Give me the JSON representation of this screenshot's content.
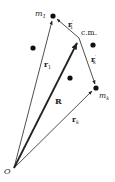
{
  "diagram": {
    "points": {
      "origin": {
        "label": "O",
        "x": 14,
        "y": 168
      },
      "m1": {
        "label": "m",
        "sub": "1",
        "x": 53,
        "y": 16
      },
      "cm": {
        "label": "c.m.",
        "x": 79,
        "y": 38
      },
      "mk": {
        "label": "m",
        "sub": "k",
        "x": 96,
        "y": 88
      }
    },
    "extra_masses": [
      {
        "x": 33,
        "y": 48
      },
      {
        "x": 93,
        "y": 45
      },
      {
        "x": 70,
        "y": 78
      }
    ],
    "vectors": [
      {
        "label": "r",
        "sub": "1",
        "from": "origin",
        "to": "m1",
        "weight": "thin"
      },
      {
        "label": "R",
        "sub": "",
        "from": "origin",
        "to": "cm",
        "weight": "bold"
      },
      {
        "label": "r",
        "sub": "k",
        "from": "origin",
        "to": "mk",
        "weight": "thin"
      },
      {
        "label": "r",
        "sub": "1",
        "prime": "′",
        "from": "cm",
        "to": "m1",
        "weight": "thin"
      },
      {
        "label": "r",
        "sub": "k",
        "prime": "′",
        "from": "cm",
        "to": "mk",
        "weight": "thin"
      }
    ],
    "colors": {
      "stroke": "#222222",
      "dot": "#111111",
      "background": "#ffffff"
    }
  }
}
